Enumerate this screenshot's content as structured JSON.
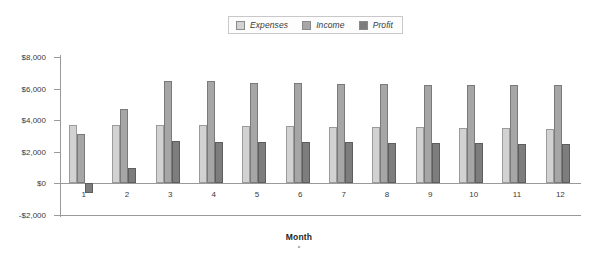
{
  "chart_data": {
    "type": "bar",
    "title": "",
    "xlabel": "Month",
    "ylabel": "",
    "categories": [
      "1",
      "2",
      "3",
      "4",
      "5",
      "6",
      "7",
      "8",
      "9",
      "10",
      "11",
      "12"
    ],
    "ylim": [
      -2000,
      8000
    ],
    "ytick_values": [
      -2000,
      0,
      2000,
      4000,
      6000,
      8000
    ],
    "ytick_labels": [
      "-$2,000",
      "$0",
      "$2,000",
      "$4,000",
      "$6,000",
      "$8,000"
    ],
    "grid": false,
    "legend_position": "top-center",
    "series": [
      {
        "name": "Expenses",
        "color": "#d2d2d2",
        "values": [
          3700,
          3700,
          3700,
          3700,
          3650,
          3650,
          3600,
          3600,
          3550,
          3500,
          3500,
          3450
        ]
      },
      {
        "name": "Income",
        "color": "#a6a6a6",
        "values": [
          3100,
          4700,
          6450,
          6450,
          6350,
          6350,
          6300,
          6300,
          6250,
          6250,
          6200,
          6200
        ]
      },
      {
        "name": "Profit",
        "color": "#7d7d7d",
        "values": [
          -600,
          1000,
          2700,
          2650,
          2600,
          2600,
          2600,
          2550,
          2550,
          2550,
          2500,
          2500
        ]
      }
    ]
  },
  "legend": {
    "entries": [
      {
        "label": "Expenses",
        "icon": "legend-swatch-expenses"
      },
      {
        "label": "Income",
        "icon": "legend-swatch-income"
      },
      {
        "label": "Profit",
        "icon": "legend-swatch-profit"
      }
    ]
  },
  "axis": {
    "x_title": "Month",
    "x_title_tick": "•"
  }
}
